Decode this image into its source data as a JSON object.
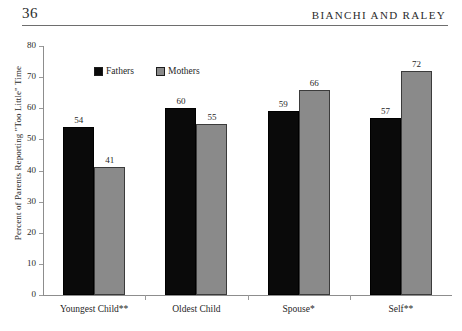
{
  "header": {
    "folio": "36",
    "running_title": "BIANCHI AND RALEY"
  },
  "chart_data": {
    "type": "bar",
    "title": "",
    "xlabel": "",
    "ylabel": "Percent of Parents Reporting \"Too Little\" Time",
    "ylim": [
      0,
      80
    ],
    "ytick_step": 10,
    "yticks": [
      "80",
      "70",
      "60",
      "50",
      "40",
      "30",
      "20",
      "10",
      "0"
    ],
    "grid": false,
    "legend_position": "top-left-inside",
    "categories": [
      "Youngest Child**",
      "Oldest Child",
      "Spouse*",
      "Self**"
    ],
    "series": [
      {
        "name": "Fathers",
        "color": "#0a0a0a",
        "values": [
          54,
          60,
          59,
          57
        ]
      },
      {
        "name": "Mothers",
        "color": "#8a8a8a",
        "values": [
          41,
          55,
          66,
          72
        ]
      }
    ]
  }
}
